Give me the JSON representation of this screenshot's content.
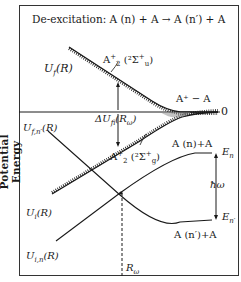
{
  "title": "De-excitation:  A (n) + A → A (n′) + A",
  "y_axis_label": "Potential Energy",
  "labels": {
    "uf": "U",
    "uf_sub": "f",
    "uf_arg": "(R)",
    "ufn": "U",
    "ufn_sub": "f,n′",
    "ufn_arg": "(R)",
    "ui": "U",
    "ui_sub": "i",
    "ui_arg": "(R)",
    "uin": "U",
    "uin_sub": "i,n",
    "uin_arg": "(R)",
    "state_u": "A",
    "state_u_sup": "+",
    "state_u_sub": "2",
    "state_u_term": "(²Σ",
    "state_u_term_sup": "+",
    "state_u_term_sub": "u",
    "state_u_close": ")",
    "state_g": "A",
    "state_g_sup": "+",
    "state_g_sub": "2",
    "state_g_term": "(²Σ",
    "state_g_term_sup": "+",
    "state_g_term_sub": "g",
    "state_g_close": ")",
    "asymptote": "A⁺ − A",
    "zero": "0",
    "delta_u": "ΔU",
    "delta_u_sub": "fi",
    "delta_u_arg": "(R",
    "delta_u_arg_sub": "ω",
    "delta_u_close": ")",
    "an_a": "A (n)+A",
    "anp_a": "A (n′)+A",
    "en": "E",
    "en_sub": "n",
    "enp": "E",
    "enp_sub": "n′",
    "hbar_omega": "ħω",
    "r_omega": "R",
    "r_omega_sub": "ω"
  },
  "colors": {
    "line": "#1a1a1a",
    "frame": "#333333",
    "background": "#ffffff"
  }
}
